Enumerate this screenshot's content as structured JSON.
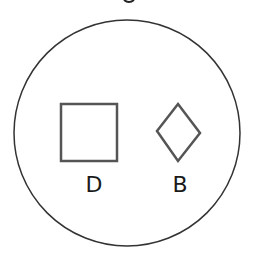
{
  "diagram": {
    "container": {
      "shape": "circle",
      "stroke": "#333333"
    },
    "shapes": [
      {
        "name": "square",
        "label": "D",
        "stroke": "#555555"
      },
      {
        "name": "diamond",
        "label": "B",
        "stroke": "#555555"
      }
    ]
  }
}
